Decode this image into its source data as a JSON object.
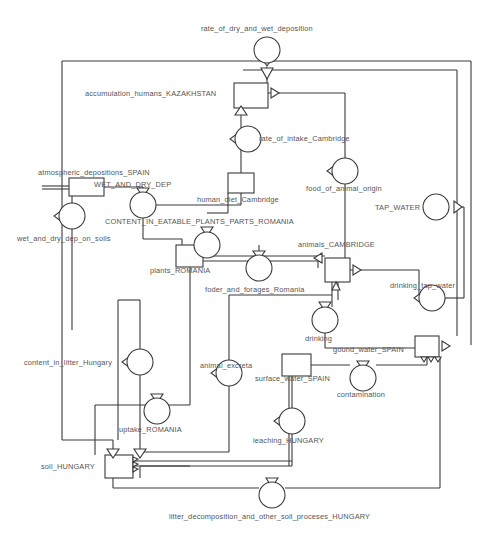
{
  "diagram": {
    "type": "stock-and-flow-system-dynamics",
    "title": "",
    "background_color": "#ffffff",
    "line_color": "#3a3a3a",
    "label_color": "#555555",
    "stock_fill": "#ffffff",
    "flow_fill": "#ffffff"
  },
  "stocks": [
    {
      "id": "accumulation_humans_KAZAKHSTAN",
      "label": "accumulation_humans_KAZAKHSTAN",
      "x": 234,
      "y": 83,
      "w": 34,
      "h": 25,
      "label_x": 85,
      "label_y": 89
    },
    {
      "id": "WET_AND_DRY_DEP",
      "label": "WET_AND_DRY_DEP",
      "x": 69,
      "y": 178,
      "w": 35,
      "h": 18,
      "label_x": 94,
      "label_y": 180
    },
    {
      "id": "human_diet_Cambridge",
      "label": "human_diet_Cambridge",
      "x": 228,
      "y": 173,
      "w": 26,
      "h": 20,
      "label_x": 197,
      "label_y": 195
    },
    {
      "id": "plants_ROMANIA",
      "label": "plants_ROMANIA",
      "x": 176,
      "y": 245,
      "w": 27,
      "h": 22,
      "label_x": 150,
      "label_y": 266
    },
    {
      "id": "animals_CAMBRIDGE",
      "label": "animals_CAMBRIDGE",
      "x": 325,
      "y": 258,
      "w": 25,
      "h": 24,
      "label_x": 298,
      "label_y": 240
    },
    {
      "id": "gound_water_SPAIN",
      "label": "gound_water_SPAIN",
      "x": 415,
      "y": 336,
      "w": 24,
      "h": 21,
      "label_x": 333,
      "label_y": 345
    },
    {
      "id": "surface_water_SPAIN",
      "label": "surface_water_SPAIN",
      "x": 282,
      "y": 354,
      "w": 29,
      "h": 22,
      "label_x": 255,
      "label_y": 374
    },
    {
      "id": "soil_HUNGARY",
      "label": "soil_HUNGARY",
      "x": 105,
      "y": 455,
      "w": 28,
      "h": 23,
      "label_x": 41,
      "label_y": 462
    }
  ],
  "flows": [
    {
      "id": "rate_of_dry_and_wet_deposition",
      "label": "rate_of_dry_and_wet_deposition",
      "cx": 267,
      "cy": 50,
      "r": 13,
      "label_x": 201,
      "label_y": 24,
      "valve_x": 267,
      "valve_y": 62,
      "valve_dir": "down"
    },
    {
      "id": "rate_of_intake_Cambridge",
      "label": "rate_of_intake_Cambridge",
      "cx": 248,
      "cy": 139,
      "r": 13,
      "label_x": 259,
      "label_y": 134,
      "valve_x": 235,
      "valve_y": 139,
      "valve_dir": "left"
    },
    {
      "id": "wet_and_dry_dep_on_soils",
      "label": "wet_and_dry_dep_on_soils",
      "cx": 72,
      "cy": 216,
      "r": 13,
      "label_x": 17,
      "label_y": 234,
      "valve_x": 59,
      "valve_y": 216,
      "valve_dir": "left"
    },
    {
      "id": "CONTENT_IN_EATABLE_PLANTS_PARTS_ROMANIA",
      "label": "CONTENT_IN_EATABLE_PLANTS_PARTS_ROMANIA",
      "cx": 143,
      "cy": 205,
      "r": 13,
      "label_x": 105,
      "label_y": 217,
      "valve_x": 143,
      "valve_y": 193,
      "valve_dir": "down"
    },
    {
      "id": "food_of_animal_origin",
      "label": "food_of_animal_origin",
      "cx": 345,
      "cy": 171,
      "r": 13,
      "label_x": 306,
      "label_y": 184,
      "valve_x": 332,
      "valve_y": 171,
      "valve_dir": "left"
    },
    {
      "id": "TAP_WATER",
      "label": "TAP_WATER",
      "cx": 436,
      "cy": 207,
      "r": 13,
      "label_x": 375,
      "label_y": 203,
      "valve_x": 451,
      "valve_y": 207,
      "valve_dir": "right"
    },
    {
      "id": "plants_to_human_flow",
      "label": "",
      "cx": 207,
      "cy": 245,
      "r": 13,
      "label_x": 0,
      "label_y": 0,
      "valve_x": 207,
      "valve_y": 232,
      "valve_dir": "down"
    },
    {
      "id": "foder_and_forages_Romania",
      "label": "foder_and_forages_Romania",
      "cx": 259,
      "cy": 268,
      "r": 13,
      "label_x": 205,
      "label_y": 285,
      "valve_x": 259,
      "valve_y": 256,
      "valve_dir": "down"
    },
    {
      "id": "drinking_tap_water",
      "label": "drinking_tap_water",
      "cx": 432,
      "cy": 298,
      "r": 13,
      "label_x": 390,
      "label_y": 281,
      "valve_x": 419,
      "valve_y": 298,
      "valve_dir": "left"
    },
    {
      "id": "drinking",
      "label": "drinking",
      "cx": 325,
      "cy": 320,
      "r": 13,
      "label_x": 305,
      "label_y": 334,
      "valve_x": 325,
      "valve_y": 307,
      "valve_dir": "down"
    },
    {
      "id": "contamination",
      "label": "contamination",
      "cx": 363,
      "cy": 378,
      "r": 13,
      "label_x": 337,
      "label_y": 390,
      "valve_x": 363,
      "valve_y": 366,
      "valve_dir": "down"
    },
    {
      "id": "content_in_litter_Hungary",
      "label": "content_in_litter_Hungary",
      "cx": 140,
      "cy": 362,
      "r": 13,
      "label_x": 24,
      "label_y": 358,
      "valve_x": 127,
      "valve_y": 362,
      "valve_dir": "left"
    },
    {
      "id": "animal_excreta",
      "label": "animal_excreta",
      "cx": 229,
      "cy": 373,
      "r": 13,
      "label_x": 200,
      "label_y": 361,
      "valve_x": 216,
      "valve_y": 373,
      "valve_dir": "left"
    },
    {
      "id": "leaching_HUNGARY",
      "label": "leaching_HUNGARY",
      "cx": 292,
      "cy": 421,
      "r": 13,
      "label_x": 253,
      "label_y": 436,
      "valve_x": 279,
      "valve_y": 421,
      "valve_dir": "left"
    },
    {
      "id": "uptake_ROMANIA",
      "label": "uptake_ROMANIA",
      "cx": 157,
      "cy": 411,
      "r": 13,
      "label_x": 119,
      "label_y": 425,
      "valve_x": 157,
      "valve_y": 399,
      "valve_dir": "down"
    },
    {
      "id": "litter_decomposition_and_other_soil_proceses_HUNGARY",
      "label": "litter_decomposition_and_other_soil_proceses_HUNGARY",
      "cx": 272,
      "cy": 495,
      "r": 13,
      "label_x": 169,
      "label_y": 512,
      "valve_x": 272,
      "valve_y": 483,
      "valve_dir": "down"
    }
  ],
  "floating_labels": [
    {
      "id": "atmospheric_depositions_SPAIN",
      "label": "atmospheric_depositions_SPAIN",
      "x": 38,
      "y": 168
    }
  ]
}
